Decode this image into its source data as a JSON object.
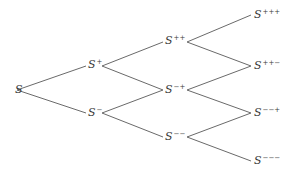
{
  "diagram": {
    "type": "binomial-tree",
    "nodes": [
      {
        "id": "S",
        "base": "S",
        "sup": "",
        "x": 22,
        "y": 90
      },
      {
        "id": "Sp",
        "base": "S",
        "sup": "+",
        "x": 95,
        "y": 66
      },
      {
        "id": "Sm",
        "base": "S",
        "sup": "−",
        "x": 95,
        "y": 113
      },
      {
        "id": "Spp",
        "base": "S",
        "sup": "++",
        "x": 172,
        "y": 42
      },
      {
        "id": "Smp",
        "base": "S",
        "sup": "−+",
        "x": 172,
        "y": 90
      },
      {
        "id": "Smm",
        "base": "S",
        "sup": "−−",
        "x": 172,
        "y": 137
      },
      {
        "id": "Sppp",
        "base": "S",
        "sup": "+++",
        "x": 262,
        "y": 15
      },
      {
        "id": "Sppm",
        "base": "S",
        "sup": "++−",
        "x": 262,
        "y": 66
      },
      {
        "id": "Smmp",
        "base": "S",
        "sup": "−−+",
        "x": 262,
        "y": 113
      },
      {
        "id": "Smmm",
        "base": "S",
        "sup": "−−−",
        "x": 262,
        "y": 161
      }
    ],
    "edges": [
      [
        17,
        90,
        86,
        66
      ],
      [
        17,
        90,
        86,
        113
      ],
      [
        102,
        66,
        163,
        42
      ],
      [
        102,
        66,
        163,
        90
      ],
      [
        102,
        113,
        163,
        90
      ],
      [
        102,
        113,
        163,
        137
      ],
      [
        187,
        42,
        251,
        15
      ],
      [
        187,
        42,
        251,
        66
      ],
      [
        187,
        90,
        251,
        66
      ],
      [
        187,
        90,
        251,
        113
      ],
      [
        187,
        137,
        251,
        113
      ],
      [
        187,
        137,
        251,
        161
      ]
    ]
  },
  "labels": {
    "S": "S",
    "Sp": "+",
    "Sm": "−",
    "Spp": "++",
    "Smp": "−+",
    "Smm": "−−",
    "Sppp": "+++",
    "Sppm": "++−",
    "Smmp": "−−+",
    "Smmm": "−−−"
  }
}
